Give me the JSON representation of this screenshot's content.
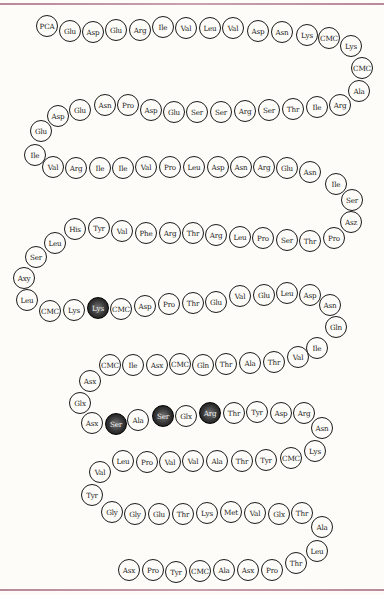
{
  "colors": {
    "rule": "#b88a9a",
    "circle_stroke": "#1a1a1a",
    "highlight_fill": "#222222",
    "background": "#fdfcf8"
  },
  "residues": [
    {
      "label": "PCA",
      "x": 47,
      "y": 26
    },
    {
      "label": "Glu",
      "x": 70,
      "y": 31
    },
    {
      "label": "Asp",
      "x": 93,
      "y": 32
    },
    {
      "label": "Glu",
      "x": 116,
      "y": 30
    },
    {
      "label": "Arg",
      "x": 140,
      "y": 30
    },
    {
      "label": "Ile",
      "x": 163,
      "y": 27
    },
    {
      "label": "Val",
      "x": 186,
      "y": 28
    },
    {
      "label": "Leu",
      "x": 210,
      "y": 28
    },
    {
      "label": "Val",
      "x": 233,
      "y": 28
    },
    {
      "label": "Asp",
      "x": 258,
      "y": 31
    },
    {
      "label": "Asn",
      "x": 282,
      "y": 32
    },
    {
      "label": "Lys",
      "x": 307,
      "y": 35
    },
    {
      "label": "CMC",
      "x": 329,
      "y": 38
    },
    {
      "label": "Lys",
      "x": 351,
      "y": 46
    },
    {
      "label": "CMC",
      "x": 362,
      "y": 68
    },
    {
      "label": "Ala",
      "x": 359,
      "y": 91
    },
    {
      "label": "Arg",
      "x": 340,
      "y": 105
    },
    {
      "label": "Ile",
      "x": 317,
      "y": 107
    },
    {
      "label": "Thr",
      "x": 293,
      "y": 109
    },
    {
      "label": "Ser",
      "x": 269,
      "y": 110
    },
    {
      "label": "Arg",
      "x": 245,
      "y": 111
    },
    {
      "label": "Ser",
      "x": 221,
      "y": 112
    },
    {
      "label": "Ser",
      "x": 197,
      "y": 112
    },
    {
      "label": "Glu",
      "x": 174,
      "y": 112
    },
    {
      "label": "Asp",
      "x": 151,
      "y": 110
    },
    {
      "label": "Pro",
      "x": 128,
      "y": 105
    },
    {
      "label": "Asn",
      "x": 105,
      "y": 105
    },
    {
      "label": "Glu",
      "x": 80,
      "y": 110
    },
    {
      "label": "Asp",
      "x": 58,
      "y": 116
    },
    {
      "label": "Glu",
      "x": 41,
      "y": 131
    },
    {
      "label": "Ile",
      "x": 35,
      "y": 155
    },
    {
      "label": "Val",
      "x": 53,
      "y": 167
    },
    {
      "label": "Arg",
      "x": 76,
      "y": 168
    },
    {
      "label": "Ile",
      "x": 100,
      "y": 168
    },
    {
      "label": "Ile",
      "x": 123,
      "y": 168
    },
    {
      "label": "Val",
      "x": 146,
      "y": 167
    },
    {
      "label": "Pro",
      "x": 170,
      "y": 167
    },
    {
      "label": "Leu",
      "x": 194,
      "y": 167
    },
    {
      "label": "Asp",
      "x": 218,
      "y": 167
    },
    {
      "label": "Asn",
      "x": 241,
      "y": 167
    },
    {
      "label": "Arg",
      "x": 264,
      "y": 167
    },
    {
      "label": "Glu",
      "x": 287,
      "y": 168
    },
    {
      "label": "Asn",
      "x": 310,
      "y": 172
    },
    {
      "label": "Ile",
      "x": 336,
      "y": 184
    },
    {
      "label": "Ser",
      "x": 352,
      "y": 200
    },
    {
      "label": "Asz",
      "x": 351,
      "y": 222
    },
    {
      "label": "Pro",
      "x": 334,
      "y": 238
    },
    {
      "label": "Thr",
      "x": 310,
      "y": 241
    },
    {
      "label": "Ser",
      "x": 287,
      "y": 240
    },
    {
      "label": "Pro",
      "x": 263,
      "y": 238
    },
    {
      "label": "Leu",
      "x": 240,
      "y": 237
    },
    {
      "label": "Arg",
      "x": 216,
      "y": 235
    },
    {
      "label": "Thr",
      "x": 193,
      "y": 233
    },
    {
      "label": "Arg",
      "x": 170,
      "y": 233
    },
    {
      "label": "Phe",
      "x": 146,
      "y": 233
    },
    {
      "label": "Val",
      "x": 122,
      "y": 231
    },
    {
      "label": "Tyr",
      "x": 99,
      "y": 228
    },
    {
      "label": "His",
      "x": 75,
      "y": 229
    },
    {
      "label": "Leu",
      "x": 55,
      "y": 243
    },
    {
      "label": "Ser",
      "x": 36,
      "y": 257
    },
    {
      "label": "Axy",
      "x": 24,
      "y": 278
    },
    {
      "label": "Leu",
      "x": 27,
      "y": 300
    },
    {
      "label": "CMC",
      "x": 50,
      "y": 311
    },
    {
      "label": "Lys",
      "x": 74,
      "y": 310
    },
    {
      "label": "Lys",
      "x": 98,
      "y": 308,
      "dark": true
    },
    {
      "label": "CMC",
      "x": 121,
      "y": 309
    },
    {
      "label": "Asp",
      "x": 145,
      "y": 306
    },
    {
      "label": "Pro",
      "x": 169,
      "y": 304
    },
    {
      "label": "Thr",
      "x": 193,
      "y": 303
    },
    {
      "label": "Glu",
      "x": 216,
      "y": 302
    },
    {
      "label": "Val",
      "x": 240,
      "y": 296
    },
    {
      "label": "Glu",
      "x": 264,
      "y": 295
    },
    {
      "label": "Leu",
      "x": 287,
      "y": 293
    },
    {
      "label": "Asp",
      "x": 310,
      "y": 295
    },
    {
      "label": "Asn",
      "x": 330,
      "y": 305
    },
    {
      "label": "Gln",
      "x": 336,
      "y": 327
    },
    {
      "label": "Ile",
      "x": 317,
      "y": 348
    },
    {
      "label": "Val",
      "x": 298,
      "y": 357
    },
    {
      "label": "Thr",
      "x": 274,
      "y": 362
    },
    {
      "label": "Ala",
      "x": 250,
      "y": 363
    },
    {
      "label": "Thr",
      "x": 226,
      "y": 364
    },
    {
      "label": "Gln",
      "x": 203,
      "y": 365
    },
    {
      "label": "CMC",
      "x": 180,
      "y": 364
    },
    {
      "label": "Asx",
      "x": 157,
      "y": 365
    },
    {
      "label": "Ile",
      "x": 133,
      "y": 365
    },
    {
      "label": "CMC",
      "x": 110,
      "y": 365
    },
    {
      "label": "Asx",
      "x": 90,
      "y": 381
    },
    {
      "label": "Glx",
      "x": 80,
      "y": 403
    },
    {
      "label": "Asx",
      "x": 92,
      "y": 423
    },
    {
      "label": "Ser",
      "x": 116,
      "y": 424,
      "dark": true
    },
    {
      "label": "Ala",
      "x": 138,
      "y": 420
    },
    {
      "label": "Ser",
      "x": 163,
      "y": 416,
      "dark": true
    },
    {
      "label": "Glx",
      "x": 186,
      "y": 416
    },
    {
      "label": "Arg",
      "x": 210,
      "y": 413,
      "dark": true
    },
    {
      "label": "Thr",
      "x": 234,
      "y": 413
    },
    {
      "label": "Tyr",
      "x": 257,
      "y": 412
    },
    {
      "label": "Asp",
      "x": 281,
      "y": 413
    },
    {
      "label": "Arg",
      "x": 304,
      "y": 413
    },
    {
      "label": "Asn",
      "x": 322,
      "y": 428
    },
    {
      "label": "Lys",
      "x": 315,
      "y": 451
    },
    {
      "label": "CMC",
      "x": 291,
      "y": 458
    },
    {
      "label": "Tyr",
      "x": 266,
      "y": 460
    },
    {
      "label": "Thr",
      "x": 242,
      "y": 461
    },
    {
      "label": "Ala",
      "x": 217,
      "y": 461
    },
    {
      "label": "Val",
      "x": 193,
      "y": 461
    },
    {
      "label": "Val",
      "x": 170,
      "y": 462
    },
    {
      "label": "Pro",
      "x": 147,
      "y": 462
    },
    {
      "label": "Leu",
      "x": 123,
      "y": 461
    },
    {
      "label": "Val",
      "x": 100,
      "y": 472
    },
    {
      "label": "Tyr",
      "x": 92,
      "y": 495
    },
    {
      "label": "Gly",
      "x": 112,
      "y": 512
    },
    {
      "label": "Gly",
      "x": 135,
      "y": 514
    },
    {
      "label": "Glu",
      "x": 159,
      "y": 514
    },
    {
      "label": "Thr",
      "x": 183,
      "y": 514
    },
    {
      "label": "Lys",
      "x": 207,
      "y": 513
    },
    {
      "label": "Met",
      "x": 231,
      "y": 512
    },
    {
      "label": "Val",
      "x": 255,
      "y": 513
    },
    {
      "label": "Glx",
      "x": 279,
      "y": 514
    },
    {
      "label": "Thr",
      "x": 302,
      "y": 513
    },
    {
      "label": "Ala",
      "x": 322,
      "y": 527
    },
    {
      "label": "Leu",
      "x": 317,
      "y": 551
    },
    {
      "label": "Thr",
      "x": 296,
      "y": 563
    },
    {
      "label": "Pro",
      "x": 272,
      "y": 570
    },
    {
      "label": "Asx",
      "x": 248,
      "y": 570
    },
    {
      "label": "Ala",
      "x": 224,
      "y": 570
    },
    {
      "label": "CMC",
      "x": 200,
      "y": 571
    },
    {
      "label": "Tyr",
      "x": 176,
      "y": 572
    },
    {
      "label": "Pro",
      "x": 153,
      "y": 570
    },
    {
      "label": "Asx",
      "x": 129,
      "y": 570
    }
  ]
}
